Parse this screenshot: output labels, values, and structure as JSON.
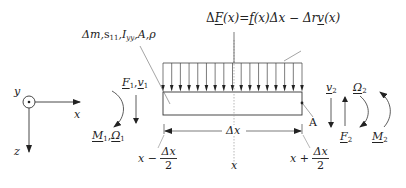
{
  "figure": {
    "type": "beam free-body diagram",
    "colors": {
      "line": "#333333",
      "dashed": "#999999",
      "text": "#222222"
    }
  },
  "axes": {
    "y_label": "y",
    "x_label": "x",
    "z_label": "z",
    "y_symbol": "out-of-plane (dot in circle)"
  },
  "labels": {
    "properties": {
      "delta": "Δ",
      "m": "m",
      "s": "s",
      "s_sub": "11",
      "I": "I",
      "I_sub": "yy",
      "A": "A",
      "rho": "ρ",
      "sep": ","
    },
    "load_equation": {
      "lhs_delta": "Δ",
      "F": "F",
      "arg": "(x)",
      "eq": "=",
      "f": "f",
      "arg2": "(x)",
      "dx": "Δx",
      "minus": "−",
      "dr": "Δr",
      "v": "v",
      "arg3": "(x)"
    },
    "left_end": {
      "F": "F",
      "F_sub": "1",
      "v": "v",
      "v_sub": "1",
      "sep": ",",
      "M": "M",
      "M_sub": "1",
      "Omega": "Ω",
      "Omega_sub": "1"
    },
    "right_end": {
      "v": "v",
      "v_sub": "2",
      "Omega": "Ω",
      "Omega_sub": "2",
      "F": "F",
      "F_sub": "2",
      "M": "M",
      "M_sub": "2"
    },
    "point_A": "A",
    "dimension": "Δx",
    "x_center": "x",
    "x_left": {
      "x": "x",
      "op": "−",
      "num": "Δx",
      "den": "2"
    },
    "x_right": {
      "x": "x",
      "op": "+",
      "num": "Δx",
      "den": "2"
    }
  },
  "geometry": {
    "beam": {
      "left": 163,
      "right": 302,
      "top": 92,
      "bottom": 115
    },
    "load_top": 63,
    "arrow_count": 17,
    "center_x": 234
  }
}
